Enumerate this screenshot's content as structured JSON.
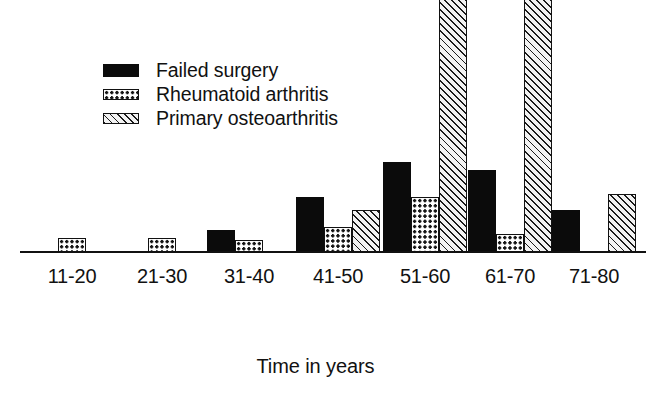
{
  "chart_data": {
    "type": "bar",
    "title": "",
    "xlabel": "Time in years",
    "ylabel": "",
    "grid": false,
    "legend_position": "upper-left",
    "categories": [
      "11-20",
      "21-30",
      "31-40",
      "41-50",
      "51-60",
      "61-70",
      "71-80"
    ],
    "series": [
      {
        "name": "Failed surgery",
        "pattern": "solid-black",
        "color": "#0b0b0b",
        "values": [
          0,
          0,
          22,
          55,
          90,
          82,
          42
        ]
      },
      {
        "name": "Rheumatoid arthritis",
        "pattern": "dotted",
        "color": "#ffffff",
        "values": [
          14,
          14,
          12,
          25,
          55,
          18,
          0
        ]
      },
      {
        "name": "Primary osteoarthritis",
        "pattern": "diagonal-hatch",
        "color": "#f2f2f2",
        "values": [
          0,
          0,
          0,
          42,
          270,
          310,
          58
        ]
      }
    ],
    "ylim": [
      0,
      320
    ],
    "axis_title": "Time in years"
  },
  "legend": {
    "items": [
      {
        "label": "Failed surgery",
        "swatch": "solid-black-swatch"
      },
      {
        "label": "Rheumatoid arthritis",
        "swatch": "dotted-swatch"
      },
      {
        "label": "Primary osteoarthritis",
        "swatch": "diagonal-hatch-swatch"
      }
    ]
  },
  "axis": {
    "x_title": "Time in years",
    "tick_labels": [
      "11-20",
      "21-30",
      "31-40",
      "41-50",
      "51-60",
      "61-70",
      "71-80"
    ]
  }
}
